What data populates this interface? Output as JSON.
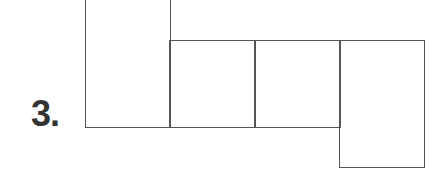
{
  "problem": {
    "number_label": "3."
  },
  "net": {
    "line_color": "#555555",
    "boxes": [
      {
        "name": "tall-box-left",
        "x": 85,
        "y": 0,
        "w": 85,
        "h": 128
      },
      {
        "name": "square-1",
        "x": 169,
        "y": 40,
        "w": 86,
        "h": 88
      },
      {
        "name": "square-2",
        "x": 254,
        "y": 40,
        "w": 86,
        "h": 88
      },
      {
        "name": "tall-box-right",
        "x": 339,
        "y": 40,
        "w": 86,
        "h": 128
      }
    ]
  }
}
